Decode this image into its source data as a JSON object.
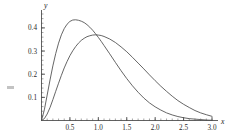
{
  "chart_data": {
    "type": "line",
    "title": "",
    "subtitle": "",
    "xlabel": "x",
    "ylabel": "y",
    "xlim": [
      0,
      3.0
    ],
    "ylim": [
      0,
      0.46
    ],
    "grid": false,
    "legend": "none",
    "x_ticks": [
      {
        "value": 0.5,
        "label": "0.5"
      },
      {
        "value": 1.0,
        "label": "1.0"
      },
      {
        "value": 1.5,
        "label": "1.5"
      },
      {
        "value": 2.0,
        "label": "2.0"
      },
      {
        "value": 2.5,
        "label": "2.5"
      },
      {
        "value": 3.0,
        "label": "3.0"
      }
    ],
    "y_ticks": [
      {
        "value": 0.1,
        "label": "0.1"
      },
      {
        "value": 0.2,
        "label": "0.2"
      },
      {
        "value": 0.3,
        "label": "0.3"
      },
      {
        "value": 0.4,
        "label": "0.4"
      }
    ],
    "x_minor_step": 0.1,
    "y_minor_step": 0.02,
    "series": [
      {
        "name": "curve-1",
        "color": "#4a4a4a",
        "peak_x": 0.72,
        "peak_y": 0.43,
        "x": [
          0.0,
          0.05,
          0.1,
          0.15,
          0.2,
          0.25,
          0.3,
          0.35,
          0.4,
          0.45,
          0.5,
          0.55,
          0.6,
          0.65,
          0.7,
          0.75,
          0.8,
          0.85,
          0.9,
          0.95,
          1.0,
          1.05,
          1.1,
          1.2,
          1.3,
          1.4,
          1.5,
          1.6,
          1.7,
          1.8,
          1.9,
          2.0,
          2.1,
          2.2,
          2.3,
          2.4,
          2.5,
          2.6,
          2.7,
          2.8,
          2.9,
          3.0
        ],
        "y": [
          0.0,
          0.046,
          0.11,
          0.175,
          0.236,
          0.289,
          0.334,
          0.37,
          0.397,
          0.416,
          0.428,
          0.434,
          0.435,
          0.433,
          0.429,
          0.423,
          0.414,
          0.403,
          0.39,
          0.375,
          0.359,
          0.342,
          0.324,
          0.288,
          0.251,
          0.215,
          0.181,
          0.15,
          0.122,
          0.097,
          0.076,
          0.059,
          0.045,
          0.033,
          0.024,
          0.017,
          0.012,
          0.008,
          0.006,
          0.004,
          0.002,
          0.001
        ]
      },
      {
        "name": "curve-2",
        "color": "#4a4a4a",
        "peak_x": 1.0,
        "peak_y": 0.37,
        "x": [
          0.0,
          0.05,
          0.1,
          0.15,
          0.2,
          0.25,
          0.3,
          0.35,
          0.4,
          0.45,
          0.5,
          0.55,
          0.6,
          0.65,
          0.7,
          0.75,
          0.8,
          0.85,
          0.9,
          0.95,
          1.0,
          1.05,
          1.1,
          1.2,
          1.3,
          1.4,
          1.5,
          1.6,
          1.7,
          1.8,
          1.9,
          2.0,
          2.1,
          2.2,
          2.3,
          2.4,
          2.5,
          2.6,
          2.7,
          2.8,
          2.9,
          3.0
        ],
        "y": [
          0.0,
          0.008,
          0.028,
          0.056,
          0.09,
          0.126,
          0.161,
          0.195,
          0.227,
          0.255,
          0.28,
          0.301,
          0.319,
          0.334,
          0.346,
          0.355,
          0.362,
          0.366,
          0.369,
          0.37,
          0.369,
          0.367,
          0.363,
          0.352,
          0.337,
          0.318,
          0.297,
          0.273,
          0.248,
          0.223,
          0.197,
          0.172,
          0.148,
          0.126,
          0.105,
          0.086,
          0.07,
          0.056,
          0.043,
          0.033,
          0.025,
          0.018
        ]
      }
    ]
  }
}
